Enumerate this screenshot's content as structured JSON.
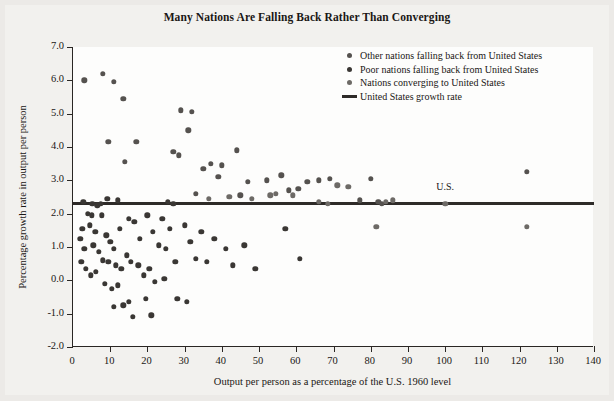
{
  "chart_data": {
    "type": "scatter",
    "title": "Many Nations Are Falling Back Rather Than Converging",
    "xlabel": "Output per person as a percentage of the U.S. 1960 level",
    "ylabel": "Percentage growth rate in output per person",
    "xlim": [
      0,
      140
    ],
    "ylim": [
      -2.0,
      7.0
    ],
    "xticks": [
      0,
      10,
      20,
      30,
      40,
      50,
      60,
      70,
      80,
      90,
      100,
      110,
      120,
      130,
      140
    ],
    "yticks": [
      "7.0",
      "6.0",
      "5.0",
      "4.0",
      "3.0",
      "2.0",
      "1.0",
      "0.0",
      "-1.0",
      "-2.0"
    ],
    "grid": false,
    "legend_position": "top-right",
    "reference_line": {
      "label": "United States growth rate",
      "value": 2.3,
      "color": "#2e2b28"
    },
    "annotations": [
      {
        "text": "U.S.",
        "x": 100,
        "y": 2.75
      }
    ],
    "legend": [
      {
        "name": "Other nations falling back from United States",
        "marker": "dot",
        "color": "#55524f"
      },
      {
        "name": "Poor nations falling back from United States",
        "marker": "dot",
        "color": "#3a3734"
      },
      {
        "name": "Nations converging to United States",
        "marker": "dot",
        "color": "#6d6a66"
      },
      {
        "name": "United States growth rate",
        "marker": "line",
        "color": "#2e2b28"
      }
    ],
    "series": [
      {
        "name": "Other nations falling back from United States",
        "color": "#55524f",
        "points": [
          [
            3.0,
            6.0
          ],
          [
            8.0,
            6.2
          ],
          [
            11.0,
            5.95
          ],
          [
            13.5,
            5.45
          ],
          [
            29.0,
            5.1
          ],
          [
            32.0,
            5.05
          ],
          [
            9.5,
            4.15
          ],
          [
            17.0,
            4.15
          ],
          [
            31.0,
            4.5
          ],
          [
            27.0,
            3.85
          ],
          [
            28.5,
            3.75
          ],
          [
            14.0,
            3.55
          ],
          [
            37.0,
            3.5
          ],
          [
            40.0,
            3.45
          ],
          [
            44.0,
            3.9
          ],
          [
            35.0,
            3.35
          ],
          [
            39.0,
            3.1
          ],
          [
            47.0,
            2.95
          ],
          [
            52.0,
            3.0
          ],
          [
            56.0,
            3.15
          ],
          [
            63.0,
            2.95
          ],
          [
            66.0,
            3.0
          ],
          [
            69.0,
            3.05
          ],
          [
            60.5,
            2.75
          ],
          [
            58.0,
            2.7
          ],
          [
            80.0,
            3.05
          ],
          [
            122.0,
            3.25
          ],
          [
            45.0,
            2.55
          ],
          [
            33.0,
            2.6
          ],
          [
            77.0,
            2.4
          ],
          [
            82.0,
            2.35
          ],
          [
            83.0,
            2.3
          ]
        ]
      },
      {
        "name": "Poor nations falling back from United States",
        "color": "#3a3734",
        "points": [
          [
            2.5,
            1.55
          ],
          [
            2.0,
            1.25
          ],
          [
            3.0,
            0.95
          ],
          [
            2.2,
            0.55
          ],
          [
            4.0,
            2.0
          ],
          [
            5.0,
            1.95
          ],
          [
            6.5,
            2.25
          ],
          [
            7.5,
            2.3
          ],
          [
            4.5,
            1.65
          ],
          [
            6.0,
            1.45
          ],
          [
            5.5,
            1.05
          ],
          [
            7.0,
            0.85
          ],
          [
            3.5,
            0.35
          ],
          [
            4.8,
            0.15
          ],
          [
            6.2,
            0.25
          ],
          [
            8.0,
            0.6
          ],
          [
            9.0,
            1.35
          ],
          [
            10.0,
            1.15
          ],
          [
            11.0,
            0.95
          ],
          [
            12.5,
            1.55
          ],
          [
            9.5,
            0.55
          ],
          [
            11.5,
            0.45
          ],
          [
            13.0,
            0.35
          ],
          [
            14.5,
            0.75
          ],
          [
            8.5,
            -0.1
          ],
          [
            10.5,
            -0.25
          ],
          [
            12.0,
            -0.15
          ],
          [
            15.0,
            1.85
          ],
          [
            16.5,
            1.75
          ],
          [
            18.0,
            1.25
          ],
          [
            15.5,
            0.55
          ],
          [
            17.5,
            0.45
          ],
          [
            19.0,
            0.15
          ],
          [
            13.5,
            -0.75
          ],
          [
            15.0,
            -0.65
          ],
          [
            11.0,
            -0.8
          ],
          [
            20.0,
            1.95
          ],
          [
            21.5,
            1.45
          ],
          [
            23.0,
            1.05
          ],
          [
            20.5,
            0.35
          ],
          [
            22.0,
            -0.05
          ],
          [
            19.5,
            -0.55
          ],
          [
            21.0,
            -1.05
          ],
          [
            16.0,
            -1.1
          ],
          [
            24.0,
            1.85
          ],
          [
            26.0,
            1.55
          ],
          [
            25.0,
            0.95
          ],
          [
            27.5,
            0.55
          ],
          [
            24.5,
            0.05
          ],
          [
            28.0,
            -0.55
          ],
          [
            30.0,
            1.65
          ],
          [
            31.5,
            1.15
          ],
          [
            33.0,
            0.65
          ],
          [
            34.5,
            1.45
          ],
          [
            36.0,
            0.55
          ],
          [
            30.5,
            -0.65
          ],
          [
            38.0,
            1.25
          ],
          [
            41.0,
            0.95
          ],
          [
            43.0,
            0.45
          ],
          [
            46.0,
            1.05
          ],
          [
            49.0,
            0.35
          ],
          [
            57.0,
            1.55
          ],
          [
            61.0,
            0.65
          ],
          [
            2.8,
            2.35
          ],
          [
            5.2,
            2.3
          ],
          [
            7.8,
            1.95
          ],
          [
            25.5,
            2.35
          ],
          [
            27.0,
            2.3
          ],
          [
            9.2,
            2.45
          ],
          [
            12.0,
            2.4
          ]
        ]
      },
      {
        "name": "Nations converging to United States",
        "color": "#6d6a66",
        "points": [
          [
            36.5,
            2.45
          ],
          [
            42.0,
            2.5
          ],
          [
            48.0,
            2.45
          ],
          [
            53.0,
            2.55
          ],
          [
            54.5,
            2.6
          ],
          [
            59.0,
            2.55
          ],
          [
            71.0,
            2.85
          ],
          [
            74.0,
            2.8
          ],
          [
            84.0,
            2.35
          ],
          [
            86.0,
            2.4
          ],
          [
            100.0,
            2.3
          ],
          [
            122.0,
            1.6
          ],
          [
            81.5,
            1.6
          ],
          [
            66.0,
            2.35
          ],
          [
            68.5,
            2.3
          ]
        ]
      }
    ]
  }
}
